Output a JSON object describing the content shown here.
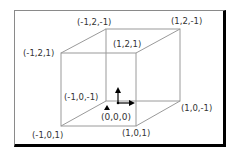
{
  "diagram": {
    "type": "unit-cube-coordinates",
    "vertices": [
      {
        "id": "back-top-left",
        "label": "(-1,2,-1)"
      },
      {
        "id": "back-top-right",
        "label": "(1,2,-1)"
      },
      {
        "id": "front-top-left",
        "label": "(-1,2,1)"
      },
      {
        "id": "front-top-right",
        "label": "(1,2,1)"
      },
      {
        "id": "back-bottom-left",
        "label": "(-1,0,-1)"
      },
      {
        "id": "back-bottom-right",
        "label": "(1,0,-1)"
      },
      {
        "id": "front-bottom-left",
        "label": "(-1,0,1)"
      },
      {
        "id": "front-bottom-right",
        "label": "(1,0,1)"
      }
    ],
    "origin": {
      "label": "(0,0,0)"
    },
    "colors": {
      "edge": "#a0a0a0",
      "arrow": "#000000",
      "frame_shadow": "#000000",
      "frame_light": "#8a8a8a"
    }
  }
}
